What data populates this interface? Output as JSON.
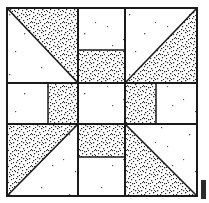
{
  "figure": {
    "block_type": "nine-patch-pinwheel",
    "grid": {
      "rows": 3,
      "cols": 3,
      "outer_left": 7,
      "outer_top": 8,
      "outer_size": 190,
      "divider_1": 78,
      "divider_2": 125
    },
    "colors": {
      "line": "#1a1a1a",
      "background": "#ffffff",
      "stipple_dot": "#2a2a2a",
      "edge_mark": "#2b2b2b",
      "speck": "#555555"
    },
    "border": {
      "stroke_width": 2,
      "label": "outer block border"
    },
    "cells": [
      {
        "id": "top-left",
        "position": "row1-col1",
        "shape": "half-square-triangle",
        "fill": "stipple",
        "stipple_corner": "top-right",
        "diagonal": "top-left-to-bottom-right",
        "x": 7,
        "y": 8,
        "w": 71,
        "h": 75
      },
      {
        "id": "top-center-upper",
        "position": "row1-col2-upper",
        "shape": "square",
        "fill": "plain",
        "x": 78,
        "y": 8,
        "w": 47,
        "h": 42
      },
      {
        "id": "top-center-lower",
        "position": "row1-col2-lower",
        "shape": "square",
        "fill": "stipple",
        "x": 78,
        "y": 50,
        "w": 47,
        "h": 33
      },
      {
        "id": "top-right",
        "position": "row1-col3",
        "shape": "half-square-triangle",
        "fill": "stipple",
        "stipple_corner": "bottom-right",
        "diagonal": "bottom-left-to-top-right",
        "x": 125,
        "y": 8,
        "w": 72,
        "h": 75
      },
      {
        "id": "middle-left-outer",
        "position": "row2-col1-left",
        "shape": "square",
        "fill": "plain",
        "x": 7,
        "y": 83,
        "w": 41,
        "h": 41
      },
      {
        "id": "middle-left-inner",
        "position": "row2-col1-right",
        "shape": "square",
        "fill": "stipple",
        "x": 48,
        "y": 83,
        "w": 30,
        "h": 41
      },
      {
        "id": "center",
        "position": "row2-col2",
        "shape": "square",
        "fill": "plain",
        "x": 78,
        "y": 83,
        "w": 47,
        "h": 41
      },
      {
        "id": "middle-right-inner",
        "position": "row2-col3-left",
        "shape": "square",
        "fill": "stipple",
        "x": 125,
        "y": 83,
        "w": 31,
        "h": 41
      },
      {
        "id": "middle-right-outer",
        "position": "row2-col3-right",
        "shape": "square",
        "fill": "plain",
        "x": 156,
        "y": 83,
        "w": 41,
        "h": 41
      },
      {
        "id": "bottom-left",
        "position": "row3-col1",
        "shape": "half-square-triangle",
        "fill": "stipple",
        "stipple_corner": "top-left",
        "diagonal": "bottom-left-to-top-right",
        "x": 7,
        "y": 124,
        "w": 71,
        "h": 72
      },
      {
        "id": "bottom-center-upper",
        "position": "row3-col2-upper",
        "shape": "square",
        "fill": "stipple",
        "x": 78,
        "y": 124,
        "w": 47,
        "h": 33
      },
      {
        "id": "bottom-center-lower",
        "position": "row3-col2-lower",
        "shape": "square",
        "fill": "plain",
        "x": 78,
        "y": 157,
        "w": 47,
        "h": 39
      },
      {
        "id": "bottom-right",
        "position": "row3-col3",
        "shape": "half-square-triangle",
        "fill": "stipple",
        "stipple_corner": "bottom-left",
        "diagonal": "top-left-to-bottom-right",
        "x": 125,
        "y": 124,
        "w": 72,
        "h": 72
      }
    ],
    "edge_mark": {
      "label": "page-edge-artifact",
      "x": 201,
      "y": 180,
      "w": 5,
      "h": 19
    }
  }
}
